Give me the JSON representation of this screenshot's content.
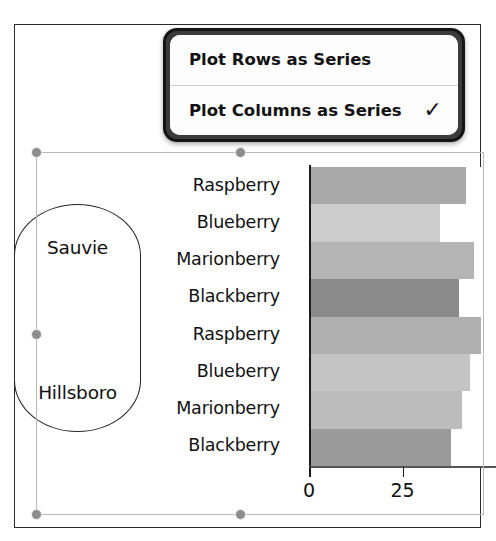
{
  "frame": {
    "name": "document-canvas"
  },
  "menu": {
    "name": "plot-series-orientation-menu",
    "items": [
      {
        "label": "Plot Rows as Series",
        "checked": false,
        "check_glyph": "✓"
      },
      {
        "label": "Plot Columns as Series",
        "checked": true,
        "check_glyph": "✓"
      }
    ]
  },
  "chart_data": {
    "type": "bar",
    "orientation": "horizontal",
    "title": "",
    "xlabel": "",
    "ylabel": "",
    "grid": false,
    "legend": "none",
    "xlim": [
      0,
      50
    ],
    "x_ticks": [
      0,
      25,
      50,
      75
    ],
    "x_tick_labels": [
      "0",
      "25",
      "",
      ""
    ],
    "visible_x_tick_labels": [
      "0",
      "25"
    ],
    "group_labels": [
      "Sauvie",
      "Hillsboro"
    ],
    "categories": [
      "Raspberry",
      "Blueberry",
      "Marionberry",
      "Blackberry",
      "Raspberry",
      "Blueberry",
      "Marionberry",
      "Blackberry"
    ],
    "values": [
      42,
      35,
      44,
      40,
      46,
      43,
      41,
      38
    ],
    "bar_colors": [
      "#a9a9a9",
      "#cccccc",
      "#b4b4b4",
      "#8a8a8a",
      "#b0b0b0",
      "#c4c4c4",
      "#bcbcbc",
      "#9a9a9a"
    ],
    "data_labels": [
      {
        "text": "35",
        "series_index": 1
      }
    ],
    "annotations": [
      {
        "type": "rounded-rect-highlight",
        "targets": [
          "Sauvie",
          "Hillsboro"
        ]
      }
    ]
  },
  "selection": {
    "name": "chart-selection",
    "handles": [
      "top-left",
      "top-middle",
      "middle-left",
      "bottom-left",
      "bottom-middle"
    ]
  }
}
